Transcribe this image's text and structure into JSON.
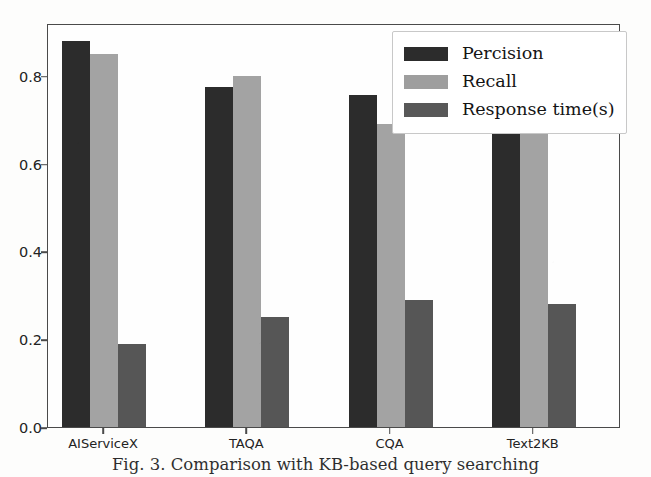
{
  "figure": {
    "caption": "Fig. 3.  Comparison with KB-based query searching",
    "background_color": "#fdfdfc"
  },
  "legend": {
    "position": "upper right",
    "entries": [
      {
        "label": "Percision",
        "color": "#2c2c2c"
      },
      {
        "label": "Recall",
        "color": "#9e9e9e"
      },
      {
        "label": "Response time(s)",
        "color": "#585858"
      }
    ]
  },
  "axes": {
    "y_ticks": [
      "0.0",
      "0.2",
      "0.4",
      "0.6",
      "0.8"
    ],
    "y_tick_values": [
      0.0,
      0.2,
      0.4,
      0.6,
      0.8
    ],
    "x_ticks": [
      "AIServiceX",
      "TAQA",
      "CQA",
      "Text2KB"
    ]
  },
  "chart_data": {
    "type": "bar",
    "title": "",
    "xlabel": "",
    "ylabel": "",
    "ylim": [
      0.0,
      0.92
    ],
    "grid": false,
    "legend_position": "upper right",
    "categories": [
      "AIServiceX",
      "TAQA",
      "CQA",
      "Text2KB"
    ],
    "series": [
      {
        "name": "Percision",
        "color": "#2c2c2c",
        "values": [
          0.88,
          0.775,
          0.755,
          0.7
        ]
      },
      {
        "name": "Recall",
        "color": "#a3a3a3",
        "values": [
          0.85,
          0.8,
          0.69,
          0.7
        ]
      },
      {
        "name": "Response time(s)",
        "color": "#565656",
        "values": [
          0.19,
          0.25,
          0.29,
          0.28
        ]
      }
    ]
  }
}
